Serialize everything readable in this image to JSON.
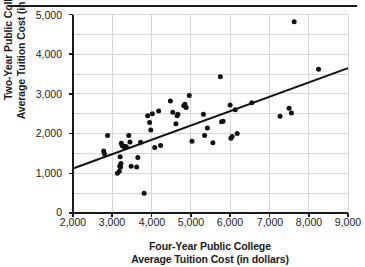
{
  "figure": {
    "has_top_rule": true,
    "background": "#ffffff",
    "ink_color": "#1a1a1a",
    "grid_color": "#d6d6d6"
  },
  "axis": {
    "x_title_line1": "Four-Year Public College",
    "x_title_line2": "Average Tuition Cost (in dollars)",
    "y_title_line1": "Two-Year Public College",
    "y_title_line2": "Average Tuition Cost (in dollars)",
    "x_ticks": [
      "2,000",
      "3,000",
      "4,000",
      "5,000",
      "6,000",
      "7,000",
      "8,000",
      "9,000"
    ],
    "y_ticks": [
      "0",
      "1,000",
      "2,000",
      "3,000",
      "4,000",
      "5,000"
    ]
  },
  "chart_data": {
    "type": "scatter",
    "title": "",
    "xlabel": "Four-Year Public College Average Tuition Cost (in dollars)",
    "ylabel": "Two-Year Public College Average Tuition Cost (in dollars)",
    "xlim": [
      2000,
      9000
    ],
    "ylim": [
      0,
      5000
    ],
    "x_major_step": 1000,
    "y_major_step": 1000,
    "y_minor_step": 500,
    "grid": "horizontal gridlines every 500, vertical gridlines every 1000",
    "legend": "none",
    "marker": {
      "shape": "circle",
      "color": "#111111",
      "size_px": 5
    },
    "trendline": {
      "present": true,
      "color": "#111111",
      "width_px": 2,
      "x_start": 2000,
      "y_start": 1120,
      "x_end": 9000,
      "y_end": 3650,
      "slope_per_dollar": 0.3614,
      "intercept": 397
    },
    "points": [
      {
        "x": 2780,
        "y": 1560
      },
      {
        "x": 2800,
        "y": 1490
      },
      {
        "x": 2880,
        "y": 1950
      },
      {
        "x": 3130,
        "y": 1000
      },
      {
        "x": 3180,
        "y": 1050
      },
      {
        "x": 3190,
        "y": 1180
      },
      {
        "x": 3200,
        "y": 1420
      },
      {
        "x": 3210,
        "y": 1160
      },
      {
        "x": 3220,
        "y": 1250
      },
      {
        "x": 3230,
        "y": 1760
      },
      {
        "x": 3250,
        "y": 1700
      },
      {
        "x": 3300,
        "y": 1670
      },
      {
        "x": 3330,
        "y": 1680
      },
      {
        "x": 3360,
        "y": 1660
      },
      {
        "x": 3420,
        "y": 1950
      },
      {
        "x": 3450,
        "y": 1790
      },
      {
        "x": 3480,
        "y": 1180
      },
      {
        "x": 3620,
        "y": 1160
      },
      {
        "x": 3650,
        "y": 1400
      },
      {
        "x": 3720,
        "y": 1780
      },
      {
        "x": 3810,
        "y": 500
      },
      {
        "x": 3900,
        "y": 2450
      },
      {
        "x": 3950,
        "y": 2280
      },
      {
        "x": 3980,
        "y": 2090
      },
      {
        "x": 4020,
        "y": 2500
      },
      {
        "x": 4080,
        "y": 1650
      },
      {
        "x": 4180,
        "y": 2570
      },
      {
        "x": 4230,
        "y": 1700
      },
      {
        "x": 4480,
        "y": 2820
      },
      {
        "x": 4540,
        "y": 2540
      },
      {
        "x": 4620,
        "y": 2250
      },
      {
        "x": 4650,
        "y": 2450
      },
      {
        "x": 4670,
        "y": 2490
      },
      {
        "x": 4820,
        "y": 2700
      },
      {
        "x": 4850,
        "y": 2740
      },
      {
        "x": 4880,
        "y": 2660
      },
      {
        "x": 4960,
        "y": 2960
      },
      {
        "x": 5030,
        "y": 1810
      },
      {
        "x": 5320,
        "y": 2490
      },
      {
        "x": 5350,
        "y": 1950
      },
      {
        "x": 5420,
        "y": 2140
      },
      {
        "x": 5560,
        "y": 1770
      },
      {
        "x": 5750,
        "y": 3430
      },
      {
        "x": 5780,
        "y": 2300
      },
      {
        "x": 5820,
        "y": 2310
      },
      {
        "x": 6000,
        "y": 2720
      },
      {
        "x": 6020,
        "y": 1880
      },
      {
        "x": 6050,
        "y": 1930
      },
      {
        "x": 6130,
        "y": 2600
      },
      {
        "x": 6180,
        "y": 2000
      },
      {
        "x": 6550,
        "y": 2780
      },
      {
        "x": 7270,
        "y": 2440
      },
      {
        "x": 7500,
        "y": 2640
      },
      {
        "x": 7560,
        "y": 2520
      },
      {
        "x": 7630,
        "y": 4820
      },
      {
        "x": 8250,
        "y": 3620
      }
    ]
  }
}
